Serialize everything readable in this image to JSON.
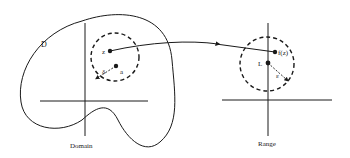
{
  "diagram": {
    "colors": {
      "stroke": "#1a1a1a",
      "background": "#ffffff"
    },
    "domain": {
      "region_label": "D",
      "caption": "Domain",
      "points": [
        {
          "id": "z",
          "label": "z"
        },
        {
          "id": "a",
          "label": "a"
        }
      ],
      "radius_label": "δ"
    },
    "range": {
      "caption": "Range",
      "points": [
        {
          "id": "fz",
          "label": "f(z)"
        },
        {
          "id": "L",
          "label": "L"
        }
      ],
      "radius_label": "ε"
    },
    "mapping_arrow": {
      "from": "z",
      "to": "f(z)"
    }
  }
}
